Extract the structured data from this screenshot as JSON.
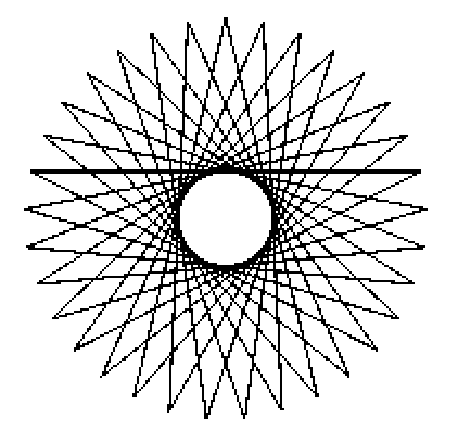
{
  "page": {
    "width": 458,
    "height": 430,
    "background_color": "#ffffff"
  },
  "figure": {
    "name": "star-polygon",
    "stroke_color": "#000000",
    "fill_color": "none",
    "background_color": "#ffffff",
    "render_style": "aliased-bitmap",
    "line_width_px": 2.1,
    "symmetry": "bilateral and rotational",
    "has_center_hole": true
  },
  "chart_data": {
    "type": "line",
    "title": "",
    "subtitle": "",
    "xlabel": "",
    "ylabel": "",
    "grid": false,
    "legend": "none",
    "axes_visible": false,
    "tick_labels": [],
    "annotations": [],
    "geometry": {
      "shape": "star_polygon",
      "schlafli_n": 33,
      "schlafli_k": 14,
      "vertex_count": 33,
      "step": 14,
      "center_x": 226,
      "center_y": 219,
      "outer_radius": 201,
      "inner_hole_radius": 38,
      "start_angle_deg": -90,
      "closed": true
    },
    "bounding_box": {
      "left": 25,
      "top": 19,
      "right": 430,
      "bottom": 410
    },
    "measured_tips": [
      {
        "label": "top-1",
        "x": 204,
        "y": 19
      },
      {
        "label": "top-2",
        "x": 243,
        "y": 19
      },
      {
        "label": "upper-left-1",
        "x": 164,
        "y": 22
      },
      {
        "label": "upper-right-1",
        "x": 285,
        "y": 30
      },
      {
        "label": "upper-left-2",
        "x": 125,
        "y": 31
      },
      {
        "label": "upper-right-2",
        "x": 325,
        "y": 52
      },
      {
        "label": "upper-left-3",
        "x": 92,
        "y": 48
      },
      {
        "label": "upper-right-3",
        "x": 358,
        "y": 70
      },
      {
        "label": "left-1",
        "x": 62,
        "y": 100
      },
      {
        "label": "right-1",
        "x": 385,
        "y": 120
      },
      {
        "label": "left-2",
        "x": 42,
        "y": 137
      },
      {
        "label": "right-2",
        "x": 405,
        "y": 150
      },
      {
        "label": "left-3",
        "x": 30,
        "y": 178
      },
      {
        "label": "right-3",
        "x": 422,
        "y": 190
      },
      {
        "label": "left-4",
        "x": 25,
        "y": 219
      },
      {
        "label": "right-4",
        "x": 430,
        "y": 219
      },
      {
        "label": "bottom-1",
        "x": 204,
        "y": 408
      },
      {
        "label": "bottom-2",
        "x": 243,
        "y": 408
      }
    ],
    "center_hole": {
      "left": 188,
      "top": 182,
      "right": 265,
      "bottom": 256,
      "fill": "#ffffff"
    }
  }
}
